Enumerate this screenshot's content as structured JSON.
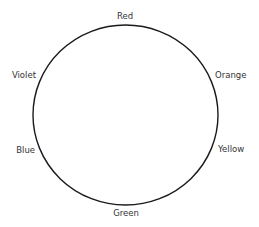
{
  "diagram": {
    "type": "color-wheel",
    "shape": "circle",
    "stroke_color": "#1a1a1a",
    "background": "#ffffff",
    "labels": [
      {
        "text": "Red",
        "position": "top"
      },
      {
        "text": "Orange",
        "position": "upper-right"
      },
      {
        "text": "Yellow",
        "position": "lower-right"
      },
      {
        "text": "Green",
        "position": "bottom"
      },
      {
        "text": "Blue",
        "position": "lower-left"
      },
      {
        "text": "Violet",
        "position": "upper-left"
      }
    ]
  }
}
